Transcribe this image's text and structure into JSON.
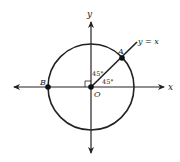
{
  "diagram": {
    "type": "unit-circle-with-line",
    "colors": {
      "stroke": "#222222",
      "background": "#ffffff"
    },
    "axes": {
      "x_label": "x",
      "y_label": "y"
    },
    "origin": {
      "label": "O"
    },
    "points": [
      {
        "label": "A",
        "description": "intersection of circle and y = x in quadrant I"
      },
      {
        "label": "B",
        "description": "intersection of circle and negative x-axis"
      }
    ],
    "line": {
      "label": "y = x"
    },
    "angles": [
      {
        "label": "45°",
        "between": "y-axis and line y = x"
      },
      {
        "label": "45°",
        "between": "x-axis and line y = x"
      }
    ],
    "right_angle_marker": true
  }
}
